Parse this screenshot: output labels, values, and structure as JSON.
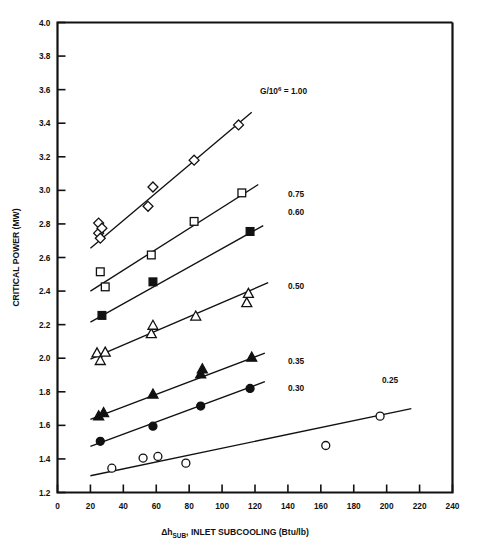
{
  "figure": {
    "background_color": "#ffffff",
    "ink_color": "#111111"
  },
  "chart_data": {
    "type": "scatter",
    "title": "",
    "xlabel": "Δh_SUB - INLET SUBCOOLING (Btu/lb)",
    "xlabel_parts": {
      "delta_h": "Δh",
      "subscript": "SUB",
      "rest": ", INLET SUBCOOLING (Btu/lb)"
    },
    "ylabel": "CRITICAL POWER (MW)",
    "xlim": [
      0,
      240
    ],
    "ylim": [
      1.2,
      4.0
    ],
    "xticks": [
      0,
      20,
      40,
      60,
      80,
      100,
      120,
      140,
      160,
      180,
      200,
      220,
      240
    ],
    "yticks": [
      1.2,
      1.4,
      1.6,
      1.8,
      2.0,
      2.2,
      2.4,
      2.6,
      2.8,
      3.0,
      3.2,
      3.4,
      3.6,
      3.8,
      4.0
    ],
    "xticklabels": [
      "0",
      "20",
      "40",
      "60",
      "80",
      "100",
      "120",
      "140",
      "160",
      "180",
      "200",
      "220",
      "240"
    ],
    "yticklabels": [
      "1.2",
      "1.4",
      "1.6",
      "1.8",
      "2.0",
      "2.2",
      "2.4",
      "2.6",
      "2.8",
      "3.0",
      "3.2",
      "3.4",
      "3.6",
      "3.8",
      "4.0"
    ],
    "grid": false,
    "legend_position": "inline-right-of-each-line",
    "annotations": [
      {
        "name": "mass-flux-annotation",
        "text": "G/10⁶ = 1.00",
        "text_parts": {
          "prefix": "G/10",
          "exponent": "6",
          "suffix": " = 1.00"
        },
        "x_px": 260,
        "y_px": 94
      }
    ],
    "series": [
      {
        "name": "G/10^6 = 1.00",
        "label": "1.00",
        "label_shown_as_annotation": true,
        "marker": "diamond-open",
        "marker_filled": false,
        "points": [
          {
            "x": 25,
            "y": 2.805
          },
          {
            "x": 25,
            "y": 2.745
          },
          {
            "x": 26,
            "y": 2.715
          },
          {
            "x": 27,
            "y": 2.775
          },
          {
            "x": 55,
            "y": 2.905
          },
          {
            "x": 58,
            "y": 3.02
          },
          {
            "x": 83,
            "y": 3.18
          },
          {
            "x": 110,
            "y": 3.39
          }
        ],
        "fit_line": {
          "x1": 20,
          "y1": 2.655,
          "x2": 118,
          "y2": 3.465
        }
      },
      {
        "name": "G/10^6 = 0.75",
        "label": "0.75",
        "label_shown_as_annotation": false,
        "label_x_px": 288,
        "label_y_px": 197,
        "marker": "square-open",
        "marker_filled": false,
        "points": [
          {
            "x": 26,
            "y": 2.515
          },
          {
            "x": 29,
            "y": 2.425
          },
          {
            "x": 57,
            "y": 2.615
          },
          {
            "x": 83,
            "y": 2.815
          },
          {
            "x": 112,
            "y": 2.985
          }
        ],
        "fit_line": {
          "x1": 20,
          "y1": 2.4,
          "x2": 122,
          "y2": 3.035
        }
      },
      {
        "name": "G/10^6 = 0.60",
        "label": "0.60",
        "label_shown_as_annotation": false,
        "label_x_px": 288,
        "label_y_px": 215,
        "marker": "square-filled",
        "marker_filled": true,
        "points": [
          {
            "x": 27,
            "y": 2.255
          },
          {
            "x": 58,
            "y": 2.455
          },
          {
            "x": 117,
            "y": 2.755
          }
        ],
        "fit_line": {
          "x1": 20,
          "y1": 2.215,
          "x2": 125,
          "y2": 2.79
        }
      },
      {
        "name": "G/10^6 = 0.50",
        "label": "0.50",
        "label_shown_as_annotation": false,
        "label_x_px": 288,
        "label_y_px": 289,
        "marker": "triangle-open",
        "marker_filled": false,
        "points": [
          {
            "x": 24,
            "y": 2.03
          },
          {
            "x": 26,
            "y": 1.985
          },
          {
            "x": 29,
            "y": 2.035
          },
          {
            "x": 57,
            "y": 2.145
          },
          {
            "x": 58,
            "y": 2.195
          },
          {
            "x": 84,
            "y": 2.25
          },
          {
            "x": 115,
            "y": 2.33
          },
          {
            "x": 116,
            "y": 2.385
          }
        ],
        "fit_line": {
          "x1": 20,
          "y1": 1.995,
          "x2": 128,
          "y2": 2.45
        }
      },
      {
        "name": "G/10^6 = 0.35",
        "label": "0.35",
        "label_shown_as_annotation": false,
        "label_x_px": 288,
        "label_y_px": 364,
        "marker": "triangle-filled",
        "marker_filled": true,
        "points": [
          {
            "x": 25,
            "y": 1.655
          },
          {
            "x": 28,
            "y": 1.675
          },
          {
            "x": 58,
            "y": 1.785
          },
          {
            "x": 87,
            "y": 1.905
          },
          {
            "x": 88,
            "y": 1.935
          },
          {
            "x": 118,
            "y": 2.005
          }
        ],
        "fit_line": {
          "x1": 20,
          "y1": 1.635,
          "x2": 126,
          "y2": 2.03
        }
      },
      {
        "name": "G/10^6 = 0.30",
        "label": "0.30",
        "label_shown_as_annotation": false,
        "label_x_px": 288,
        "label_y_px": 391,
        "marker": "circle-filled",
        "marker_filled": true,
        "points": [
          {
            "x": 26,
            "y": 1.505
          },
          {
            "x": 58,
            "y": 1.595
          },
          {
            "x": 87,
            "y": 1.715
          },
          {
            "x": 117,
            "y": 1.82
          }
        ],
        "fit_line": {
          "x1": 20,
          "y1": 1.475,
          "x2": 126,
          "y2": 1.86
        }
      },
      {
        "name": "G/10^6 = 0.25",
        "label": "0.25",
        "label_shown_as_annotation": false,
        "label_x_px": 382,
        "label_y_px": 383,
        "marker": "circle-open",
        "marker_filled": false,
        "points": [
          {
            "x": 33,
            "y": 1.345
          },
          {
            "x": 52,
            "y": 1.405
          },
          {
            "x": 61,
            "y": 1.415
          },
          {
            "x": 78,
            "y": 1.375
          },
          {
            "x": 163,
            "y": 1.48
          },
          {
            "x": 196,
            "y": 1.655
          }
        ],
        "fit_line": {
          "x1": 20,
          "y1": 1.3,
          "x2": 215,
          "y2": 1.7
        }
      }
    ]
  }
}
